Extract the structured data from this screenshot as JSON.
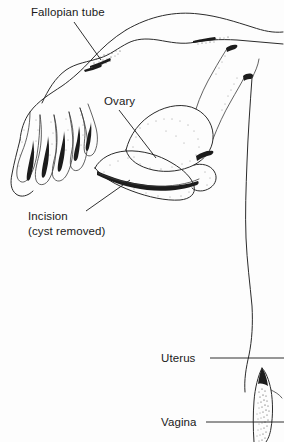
{
  "figure": {
    "background_color": "#fdfdfd",
    "ink_color": "#2b2b2b",
    "text_color": "#1a1a1a",
    "width": 284,
    "height": 442
  },
  "labels": {
    "fallopian_tube": "Fallopian tube",
    "ovary": "Ovary",
    "incision_line1": "Incision",
    "incision_line2": "(cyst removed)",
    "uterus": "Uterus",
    "vagina": "Vagina"
  },
  "structures": [
    {
      "name": "fallopian-tube",
      "label": "Fallopian tube"
    },
    {
      "name": "fimbriae",
      "label": "Fimbriae"
    },
    {
      "name": "ovary",
      "label": "Ovary"
    },
    {
      "name": "incision",
      "label": "Incision (cyst removed)"
    },
    {
      "name": "uterus",
      "label": "Uterus"
    },
    {
      "name": "vagina",
      "label": "Vagina"
    }
  ]
}
